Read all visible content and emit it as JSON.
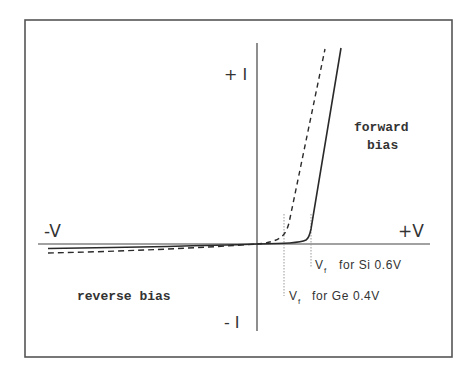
{
  "diagram": {
    "colors": {
      "frame": "#555555",
      "axes": "#444444",
      "curves": "#2a2a2a",
      "dotted": "#999999",
      "text": "#333333",
      "background": "#ffffff"
    },
    "axes": {
      "plus_i": "+ I",
      "minus_i": "- I",
      "plus_v": "+V",
      "minus_v": "-V"
    },
    "regions": {
      "forward_line1": "forward",
      "forward_line2": "bias",
      "reverse": "reverse bias"
    },
    "annotations": {
      "si": {
        "v": "V",
        "sub": "f",
        "rest": "for Si 0.6V"
      },
      "ge": {
        "v": "V",
        "sub": "f",
        "rest": "for Ge 0.4V"
      }
    },
    "curves": [
      {
        "name": "Silicon",
        "style": "solid",
        "forward_voltage": "0.6V"
      },
      {
        "name": "Germanium",
        "style": "dashed",
        "forward_voltage": "0.4V"
      }
    ]
  }
}
